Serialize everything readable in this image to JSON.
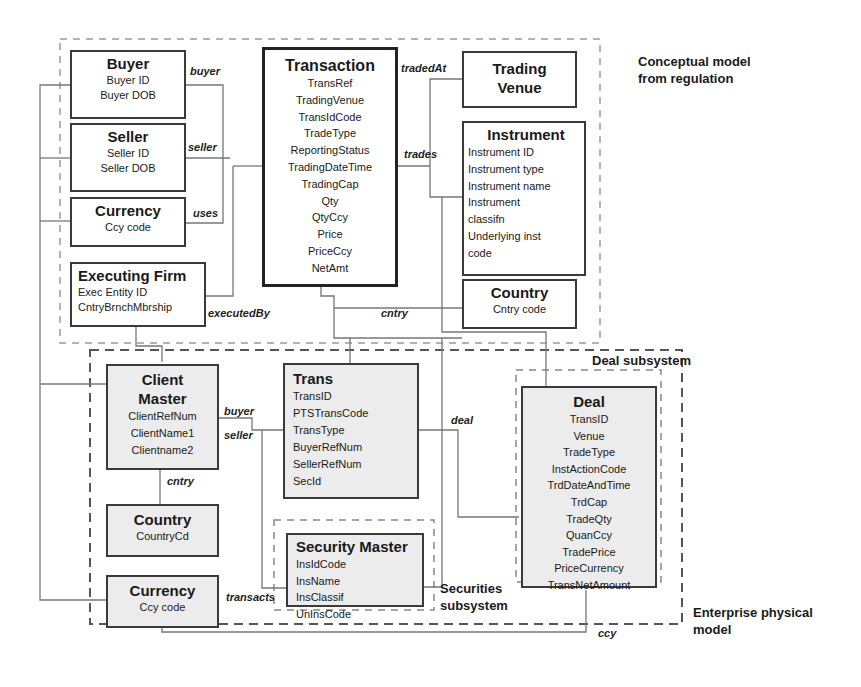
{
  "regions": {
    "conceptual": "Conceptual model\nfrom regulation",
    "conceptual_line1": "Conceptual model",
    "conceptual_line2": "from regulation",
    "enterprise_line1": "Enterprise physical",
    "enterprise_line2": "model",
    "deal_subsystem": "Deal subsystem",
    "securities_line1": "Securities",
    "securities_line2": "subsystem"
  },
  "conceptual_entities": {
    "buyer": {
      "title": "Buyer",
      "attrs": [
        "Buyer ID",
        "Buyer DOB"
      ]
    },
    "seller": {
      "title": "Seller",
      "attrs": [
        "Seller ID",
        "Seller DOB"
      ]
    },
    "currency": {
      "title": "Currency",
      "attrs": [
        "Ccy code"
      ]
    },
    "executing_firm": {
      "title": "Executing Firm",
      "attrs": [
        "Exec Entity ID",
        "CntryBrnchMbrship"
      ]
    },
    "transaction": {
      "title": "Transaction",
      "attrs": [
        "TransRef",
        "TradingVenue",
        "TransIdCode",
        "TradeType",
        "ReportingStatus",
        "TradingDateTime",
        "TradingCap",
        "Qty",
        "QtyCcy",
        "Price",
        "PriceCcy",
        "NetAmt"
      ]
    },
    "trading_venue": {
      "title_line1": "Trading",
      "title_line2": "Venue"
    },
    "instrument": {
      "title": "Instrument",
      "attrs": [
        "Instrument ID",
        "Instrument type",
        "Instrument name",
        "Instrument",
        "classifn",
        "Underlying inst",
        "code"
      ]
    },
    "country": {
      "title": "Country",
      "attrs": [
        "Cntry code"
      ]
    }
  },
  "physical_entities": {
    "client_master": {
      "title_line1": "Client",
      "title_line2": "Master",
      "attrs": [
        "ClientRefNum",
        "ClientName1",
        "Clientname2"
      ]
    },
    "trans": {
      "title": "Trans",
      "attrs": [
        "TransID",
        "PTSTransCode",
        "TransType",
        "BuyerRefNum",
        "SellerRefNum",
        "SecId"
      ]
    },
    "country": {
      "title": "Country",
      "attrs": [
        "CountryCd"
      ]
    },
    "currency": {
      "title": "Currency",
      "attrs": [
        "Ccy code"
      ]
    },
    "security_master": {
      "title": "Security Master",
      "attrs": [
        "InsIdCode",
        "InsName",
        "InsClassif",
        "UnInsCode"
      ]
    },
    "deal": {
      "title": "Deal",
      "attrs": [
        "TransID",
        "Venue",
        "TradeType",
        "InstActionCode",
        "TrdDateAndTime",
        "TrdCap",
        "TradeQty",
        "QuanCcy",
        "TradePrice",
        "PriceCurrency",
        "TransNetAmount"
      ]
    }
  },
  "relationships": {
    "buyer": "buyer",
    "seller": "seller",
    "uses": "uses",
    "tradedAt": "tradedAt",
    "trades": "trades",
    "executedBy": "executedBy",
    "cntry_conceptual": "cntry",
    "phys_buyer": "buyer",
    "phys_seller": "seller",
    "deal": "deal",
    "phys_cntry": "cntry",
    "transacts": "transacts",
    "ccy": "ccy"
  }
}
